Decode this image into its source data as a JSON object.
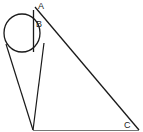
{
  "diagram": {
    "labels": {
      "A": "A",
      "B": "B",
      "C": "C"
    },
    "colors": {
      "stroke": "#1a1a1a",
      "baseline": "#555555",
      "background": "#ffffff"
    },
    "points": {
      "A": [
        35,
        6
      ],
      "B_top": [
        34,
        9
      ],
      "B_bottom": [
        34,
        52
      ],
      "apex": [
        33,
        130
      ],
      "C": [
        139,
        130
      ],
      "circle_center": [
        22,
        34
      ],
      "circle_radius": 18
    }
  }
}
